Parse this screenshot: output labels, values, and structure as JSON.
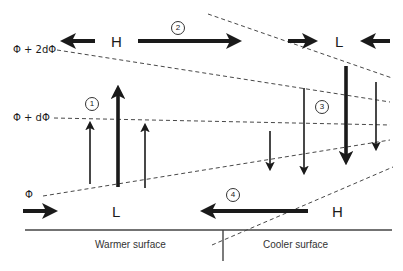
{
  "diagram": {
    "isolines": [
      {
        "label": "Φ + 2dΦ"
      },
      {
        "label": "Φ + dΦ"
      },
      {
        "label": "Φ"
      }
    ],
    "pressure_centers": {
      "top_left": "H",
      "top_right": "L",
      "bottom_left": "L",
      "bottom_right": "H"
    },
    "circulation_steps": [
      "1",
      "2",
      "3",
      "4"
    ],
    "surfaces": {
      "left": "Warmer surface",
      "right": "Cooler surface"
    },
    "colors": {
      "ink": "#1a1a1a",
      "background": "#ffffff"
    }
  }
}
